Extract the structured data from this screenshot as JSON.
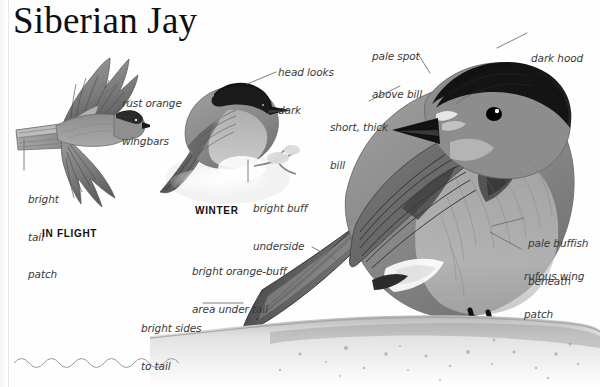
{
  "page": {
    "title": "Siberian Jay",
    "background_color": "#fefefe",
    "text_color": "#3a3a3a",
    "width": 600,
    "height": 387
  },
  "plates": [
    {
      "id": "in-flight",
      "label": "IN FLIGHT"
    },
    {
      "id": "winter",
      "label": "WINTER"
    }
  ],
  "annotations": [
    {
      "id": "rust-orange-wingbars",
      "line1": "rust orange",
      "line2": "wingbars"
    },
    {
      "id": "bright-tail-patch",
      "line1": "bright",
      "line2": "tail",
      "line3": "patch"
    },
    {
      "id": "head-looks-dark",
      "line1": "head looks",
      "line2": "dark"
    },
    {
      "id": "bright-buff-underside",
      "line1": "bright buff",
      "line2": "underside"
    },
    {
      "id": "pale-spot-above-bill",
      "line1": "pale spot",
      "line2": "above bill"
    },
    {
      "id": "short-thick-bill",
      "line1": "short, thick",
      "line2": "bill"
    },
    {
      "id": "dark-hood",
      "line1": "dark hood"
    },
    {
      "id": "pale-buffish-beneath",
      "line1": "pale buffish",
      "line2": "beneath"
    },
    {
      "id": "rufous-wing-patch",
      "line1": "rufous wing",
      "line2": "patch"
    },
    {
      "id": "bright-orange-buff-area-under-tail",
      "line1": "bright orange-buff",
      "line2": "area under tail"
    },
    {
      "id": "bright-sides-to-tail",
      "line1": "bright sides",
      "line2": "to tail"
    }
  ],
  "illustrations": [
    {
      "id": "flying-jay",
      "name": "siberian-jay-in-flight-illustration"
    },
    {
      "id": "winter-jay",
      "name": "siberian-jay-winter-illustration"
    },
    {
      "id": "main-jay",
      "name": "siberian-jay-main-illustration"
    },
    {
      "id": "wavy-rule",
      "name": "decorative-wavy-rule"
    }
  ]
}
